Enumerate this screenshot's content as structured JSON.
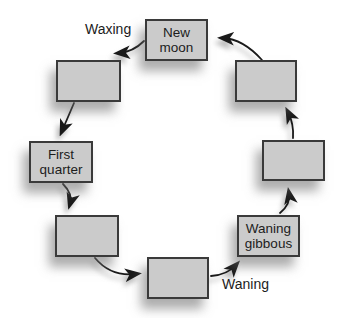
{
  "diagram": {
    "type": "cycle",
    "colors": {
      "background": "#ffffff",
      "box_fill": "#cbcbcb",
      "box_border": "#3a3a3a",
      "arrow": "#1a1a1a",
      "text": "#1c1c1c"
    },
    "flow_labels": {
      "waxing": "Waxing",
      "waning": "Waning"
    },
    "nodes": [
      {
        "id": "new-moon",
        "label": "New moon"
      },
      {
        "id": "box-upper-left",
        "label": ""
      },
      {
        "id": "first-quarter",
        "label": "First quarter"
      },
      {
        "id": "box-lower-left",
        "label": ""
      },
      {
        "id": "box-bottom",
        "label": ""
      },
      {
        "id": "waning-gibbous",
        "label": "Waning gibbous"
      },
      {
        "id": "box-right",
        "label": ""
      },
      {
        "id": "box-upper-right",
        "label": ""
      }
    ],
    "edges": [
      {
        "from": "new-moon",
        "to": "box-upper-left"
      },
      {
        "from": "box-upper-left",
        "to": "first-quarter"
      },
      {
        "from": "first-quarter",
        "to": "box-lower-left"
      },
      {
        "from": "box-lower-left",
        "to": "box-bottom"
      },
      {
        "from": "box-bottom",
        "to": "waning-gibbous"
      },
      {
        "from": "waning-gibbous",
        "to": "box-right"
      },
      {
        "from": "box-right",
        "to": "box-upper-right"
      },
      {
        "from": "box-upper-right",
        "to": "new-moon"
      }
    ]
  }
}
